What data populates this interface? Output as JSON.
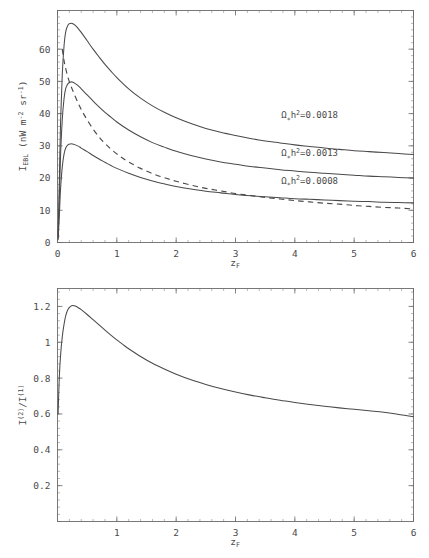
{
  "figure": {
    "title": "",
    "panels": [
      "top",
      "bottom"
    ]
  },
  "chart_data": [
    {
      "id": "top-panel",
      "type": "line",
      "title": "",
      "xlabel": "z_F",
      "xlabel_base": "z",
      "xlabel_sub": "F",
      "ylabel": "I_EBL (nW m^-2 sr^-1)",
      "ylabel_parts": {
        "symbol": "I",
        "symbol_sub": "EBL",
        "units_open": " (nW m",
        "units_exp1": "-2",
        "units_mid": " sr",
        "units_exp2": "-1",
        "units_close": ")"
      },
      "xlim": [
        0,
        6
      ],
      "ylim": [
        0,
        72
      ],
      "xticks": [
        0,
        1,
        2,
        3,
        4,
        5,
        6
      ],
      "xticklabels": [
        "0",
        "1",
        "2",
        "3",
        "4",
        "5",
        "6"
      ],
      "yticks": [
        0,
        10,
        20,
        30,
        40,
        50,
        60
      ],
      "yticklabels": [
        "0",
        "10",
        "20",
        "30",
        "40",
        "50",
        "60"
      ],
      "grid": false,
      "legend": "inline-annotations",
      "annotations": [
        {
          "text": "Ω∗h²=0.0018",
          "omega": "Ω",
          "omega_sub": "∗",
          "h": "h",
          "h_exp": "2",
          "equals_value": "=0.0018",
          "x": 4.25,
          "y": 38.5
        },
        {
          "text": "Ω∗h²=0.0013",
          "omega": "Ω",
          "omega_sub": "∗",
          "h": "h",
          "h_exp": "2",
          "equals_value": "=0.0013",
          "x": 4.25,
          "y": 26.8
        },
        {
          "text": "Ω∗h²=0.0008",
          "omega": "Ω",
          "omega_sub": "∗",
          "h": "h",
          "h_exp": "2",
          "equals_value": "=0.0008",
          "x": 4.25,
          "y": 18.2
        }
      ],
      "series": [
        {
          "name": "Ω∗h²=0.0018",
          "style": "solid",
          "peak": {
            "x": 0.25,
            "y": 68.0
          },
          "endpoint": {
            "x": 6.0,
            "y": 33.5
          },
          "x": [
            0.01,
            0.03,
            0.05,
            0.08,
            0.11,
            0.14,
            0.18,
            0.22,
            0.25,
            0.3,
            0.35,
            0.4,
            0.5,
            0.6,
            0.7,
            0.8,
            0.9,
            1.0,
            1.2,
            1.4,
            1.6,
            1.8,
            2.0,
            2.25,
            2.5,
            2.75,
            3.0,
            3.25,
            3.5,
            3.75,
            4.0,
            4.25,
            4.5,
            4.75,
            5.0,
            5.25,
            5.5,
            5.75,
            6.0
          ],
          "y": [
            2.0,
            18.0,
            36.0,
            52.0,
            61.0,
            65.5,
            67.6,
            68.0,
            68.0,
            67.4,
            66.4,
            65.2,
            62.6,
            60.0,
            57.6,
            55.3,
            53.2,
            51.2,
            47.7,
            44.8,
            42.4,
            40.4,
            38.7,
            36.9,
            35.4,
            34.2,
            33.2,
            32.3,
            31.5,
            30.9,
            30.3,
            29.8,
            29.3,
            28.9,
            28.5,
            28.2,
            27.9,
            27.6,
            27.3
          ]
        },
        {
          "name": "Ω∗h²=0.0013",
          "style": "solid",
          "peak": {
            "x": 0.25,
            "y": 49.8
          },
          "endpoint": {
            "x": 6.0,
            "y": 24.2
          },
          "x": [
            0.01,
            0.03,
            0.05,
            0.08,
            0.11,
            0.14,
            0.18,
            0.22,
            0.25,
            0.3,
            0.35,
            0.4,
            0.5,
            0.6,
            0.7,
            0.8,
            0.9,
            1.0,
            1.2,
            1.4,
            1.6,
            1.8,
            2.0,
            2.25,
            2.5,
            2.75,
            3.0,
            3.25,
            3.5,
            3.75,
            4.0,
            4.25,
            4.5,
            4.75,
            5.0,
            5.25,
            5.5,
            5.75,
            6.0
          ],
          "y": [
            1.4,
            13.0,
            26.2,
            38.0,
            44.6,
            47.9,
            49.4,
            49.8,
            49.8,
            49.3,
            48.6,
            47.7,
            45.8,
            43.9,
            42.1,
            40.4,
            38.9,
            37.4,
            34.9,
            32.8,
            31.0,
            29.6,
            28.3,
            27.0,
            25.9,
            25.0,
            24.3,
            23.6,
            23.1,
            22.6,
            22.2,
            21.8,
            21.5,
            21.2,
            20.9,
            20.6,
            20.4,
            20.2,
            20.0
          ]
        },
        {
          "name": "Ω∗h²=0.0008",
          "style": "solid",
          "peak": {
            "x": 0.26,
            "y": 30.6
          },
          "endpoint": {
            "x": 6.0,
            "y": 14.9
          },
          "x": [
            0.01,
            0.03,
            0.05,
            0.08,
            0.11,
            0.14,
            0.18,
            0.22,
            0.25,
            0.3,
            0.35,
            0.4,
            0.5,
            0.6,
            0.7,
            0.8,
            0.9,
            1.0,
            1.2,
            1.4,
            1.6,
            1.8,
            2.0,
            2.25,
            2.5,
            2.75,
            3.0,
            3.25,
            3.5,
            3.75,
            4.0,
            4.25,
            4.5,
            4.75,
            5.0,
            5.25,
            5.5,
            5.75,
            6.0
          ],
          "y": [
            0.9,
            8.0,
            16.1,
            23.4,
            27.4,
            29.4,
            30.4,
            30.6,
            30.6,
            30.3,
            29.9,
            29.3,
            28.2,
            27.0,
            25.9,
            24.9,
            23.9,
            23.0,
            21.5,
            20.2,
            19.1,
            18.2,
            17.4,
            16.6,
            15.9,
            15.4,
            14.9,
            14.5,
            14.2,
            13.9,
            13.6,
            13.4,
            13.2,
            13.0,
            12.8,
            12.7,
            12.5,
            12.4,
            12.3
          ]
        },
        {
          "name": "dashed-model",
          "style": "dashed",
          "endpoint": {
            "x": 6.0,
            "y": 9.0
          },
          "x": [
            0.08,
            0.12,
            0.18,
            0.25,
            0.35,
            0.45,
            0.6,
            0.75,
            0.9,
            1.05,
            1.2,
            1.4,
            1.6,
            1.8,
            2.0,
            2.25,
            2.5,
            2.75,
            3.0,
            3.25,
            3.5,
            3.75,
            4.0,
            4.25,
            4.5,
            4.75,
            5.0,
            5.25,
            5.5,
            5.75,
            6.0
          ],
          "y": [
            60.0,
            55.5,
            51.0,
            47.5,
            43.2,
            39.6,
            35.2,
            31.7,
            29.0,
            26.8,
            25.0,
            23.0,
            21.4,
            20.1,
            19.0,
            17.8,
            16.8,
            16.0,
            15.2,
            14.6,
            14.0,
            13.5,
            13.0,
            12.6,
            12.2,
            11.9,
            11.5,
            11.2,
            10.9,
            10.7,
            10.4
          ]
        }
      ]
    },
    {
      "id": "bottom-panel",
      "type": "line",
      "title": "",
      "xlabel": "z_F",
      "xlabel_base": "z",
      "xlabel_sub": "F",
      "ylabel": "I^(2)/I^(1)",
      "ylabel_parts": {
        "sym1": "I",
        "sup1": "(2)",
        "slash": "/",
        "sym2": "I",
        "sup2": "(1)"
      },
      "xlim": [
        0,
        6
      ],
      "ylim": [
        0,
        1.3
      ],
      "xticks": [
        1,
        2,
        3,
        4,
        5,
        6
      ],
      "xticklabels": [
        "1",
        "2",
        "3",
        "4",
        "5",
        "6"
      ],
      "yticks": [
        0.2,
        0.4,
        0.6,
        0.8,
        1.0,
        1.2
      ],
      "yticklabels": [
        "0.2",
        "0.4",
        "0.6",
        "0.8",
        "1",
        "1.2"
      ],
      "grid": false,
      "legend": "none",
      "series": [
        {
          "name": "I(2)/I(1)",
          "style": "solid",
          "peak": {
            "x": 0.26,
            "y": 1.205
          },
          "endpoint": {
            "x": 6.0,
            "y": 0.585
          },
          "x": [
            0.01,
            0.03,
            0.05,
            0.08,
            0.11,
            0.14,
            0.18,
            0.22,
            0.26,
            0.3,
            0.35,
            0.4,
            0.5,
            0.6,
            0.7,
            0.8,
            0.9,
            1.0,
            1.1,
            1.2,
            1.4,
            1.6,
            1.8,
            2.0,
            2.25,
            2.5,
            2.75,
            3.0,
            3.25,
            3.5,
            3.75,
            4.0,
            4.25,
            4.5,
            4.75,
            5.0,
            5.25,
            5.5,
            5.75,
            6.0
          ],
          "y": [
            0.6,
            0.8,
            0.92,
            1.03,
            1.1,
            1.15,
            1.185,
            1.2,
            1.205,
            1.202,
            1.193,
            1.182,
            1.155,
            1.126,
            1.097,
            1.068,
            1.04,
            1.013,
            0.988,
            0.964,
            0.921,
            0.883,
            0.851,
            0.822,
            0.791,
            0.765,
            0.742,
            0.722,
            0.705,
            0.69,
            0.676,
            0.664,
            0.653,
            0.643,
            0.634,
            0.626,
            0.618,
            0.61,
            0.597,
            0.585
          ]
        }
      ]
    }
  ]
}
